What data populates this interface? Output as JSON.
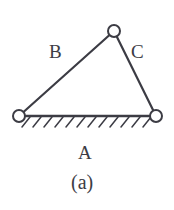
{
  "figure": {
    "type": "three-member-truss-diagram",
    "caption": "(a)",
    "background_color": "#ffffff",
    "line_color": "#3c3c44",
    "joint_fill": "#ffffff",
    "labels": {
      "member_a": "A",
      "member_b": "B",
      "member_c": "C"
    },
    "members": [
      {
        "id": "A",
        "label": "A",
        "from": "joint-left",
        "to": "joint-right",
        "role": "ground-member"
      },
      {
        "id": "B",
        "label": "B",
        "from": "joint-left",
        "to": "joint-top",
        "role": "left-member"
      },
      {
        "id": "C",
        "label": "C",
        "from": "joint-top",
        "to": "joint-right",
        "role": "right-member"
      }
    ],
    "joints": [
      {
        "id": "joint-top",
        "cx": 114,
        "cy": 31,
        "r": 6
      },
      {
        "id": "joint-left",
        "cx": 19,
        "cy": 116,
        "r": 6
      },
      {
        "id": "joint-right",
        "cx": 156,
        "cy": 116,
        "r": 6
      }
    ],
    "ground": {
      "y": 116,
      "x_start": 22,
      "x_end": 152,
      "hatch_count": 12,
      "hatch_length": 9,
      "hatch_angle_deg": 52
    }
  }
}
